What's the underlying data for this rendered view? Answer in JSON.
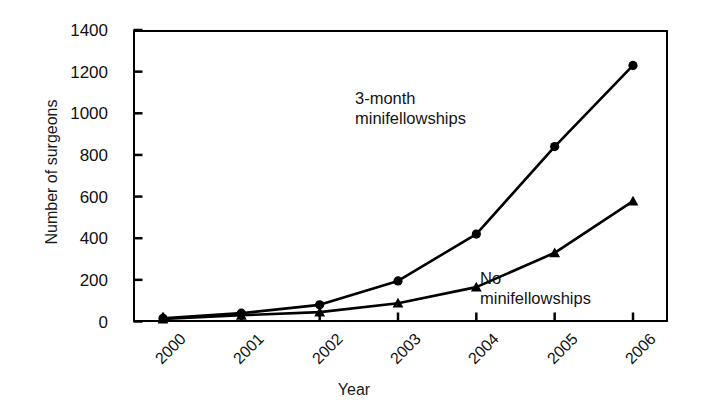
{
  "chart_data": {
    "type": "line",
    "title": "",
    "xlabel": "Year",
    "ylabel": "Number of surgeons",
    "categories": [
      "2000",
      "2001",
      "2002",
      "2003",
      "2004",
      "2005",
      "2006"
    ],
    "x": [
      2000,
      2001,
      2002,
      2003,
      2004,
      2005,
      2006
    ],
    "xlim": [
      1999.6,
      2006.4
    ],
    "ylim": [
      0,
      1400
    ],
    "yticks": [
      0,
      200,
      400,
      600,
      800,
      1000,
      1200,
      1400
    ],
    "ytick_labels": [
      "0",
      "200",
      "400",
      "600",
      "800",
      "1000",
      "1200",
      "1400"
    ],
    "grid": false,
    "legend_position": "inline-annotations",
    "series": [
      {
        "name": "3-month minifellowships",
        "marker": "circle",
        "color": "#000000",
        "values": [
          15,
          40,
          80,
          195,
          420,
          840,
          1230
        ],
        "annotation": "3-month\nminifellowships"
      },
      {
        "name": "No minifellowships",
        "marker": "triangle",
        "color": "#000000",
        "values": [
          12,
          30,
          45,
          88,
          165,
          330,
          578
        ],
        "annotation": "No\nminifellowships"
      }
    ],
    "annotations": [
      {
        "text": "3-month\nminifellowships",
        "series": "3-month minifellowships"
      },
      {
        "text": "No\nminifellowships",
        "series": "No minifellowships"
      }
    ]
  },
  "axes": {
    "y_title": "Number of surgeons",
    "x_title": "Year",
    "y_labels": [
      "1400",
      "1200",
      "1000",
      "800",
      "600",
      "400",
      "200",
      "0"
    ],
    "x_labels": [
      "2000",
      "2001",
      "2002",
      "2003",
      "2004",
      "2005",
      "2006"
    ]
  },
  "annotations": {
    "top": "3-month\nminifellowships",
    "bottom": "No\nminifellowships"
  },
  "colors": {
    "axis": "#000000",
    "series": "#000000",
    "background": "#ffffff"
  }
}
